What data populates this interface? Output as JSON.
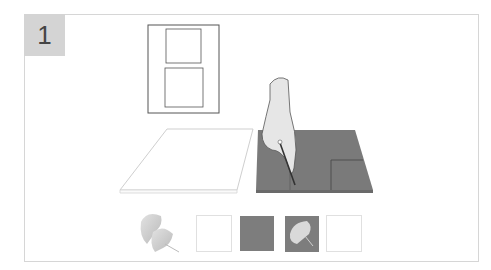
{
  "step": {
    "number": "1"
  },
  "colors": {
    "badge_bg": "#d4d4d4",
    "frame_border": "#d6d6d6",
    "mat_gray": "#7a7a7a",
    "swatch_gray": "#7d7d7d",
    "leaf_light": "#cfcfcf"
  },
  "illustration": {
    "description": "Hand cutting a window opening in a gray mat board with a craft knife; a white blank board lies to the left; a layout sketch with two rectangular windows shown above.",
    "elements": [
      "layout-sketch",
      "white-board",
      "gray-mat-board",
      "hand-with-knife"
    ]
  },
  "materials": [
    {
      "name": "ginkgo-leaves",
      "kind": "leaf-image"
    },
    {
      "name": "white-card",
      "kind": "swatch",
      "color": "#ffffff"
    },
    {
      "name": "gray-card",
      "kind": "swatch",
      "color": "#7d7d7d"
    },
    {
      "name": "leaf-on-gray",
      "kind": "swatch-leaf",
      "color": "#7d7d7d"
    },
    {
      "name": "white-card-2",
      "kind": "swatch",
      "color": "#ffffff"
    }
  ]
}
